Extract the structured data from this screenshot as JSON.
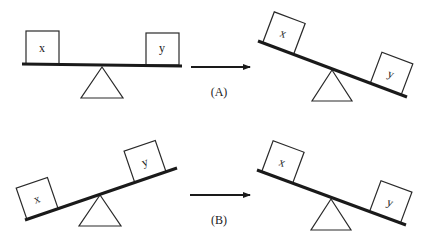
{
  "diagram": {
    "type": "seesaw-balance-comparison",
    "rows": [
      {
        "caption": "(A)",
        "before": {
          "state": "balanced",
          "left_box": "x",
          "right_box": "y"
        },
        "after": {
          "state": "tilted-left-down? no - left up, right down",
          "left_box": "x",
          "right_box": "y"
        }
      },
      {
        "caption": "(B)",
        "before": {
          "state": "left down, right up",
          "left_box": "x",
          "right_box": "y"
        },
        "after": {
          "state": "left up, right down",
          "left_box": "x",
          "right_box": "y"
        }
      }
    ]
  },
  "labels": {
    "x": "x",
    "y": "y",
    "caption_a": "(A)",
    "caption_b": "(B)"
  },
  "colors": {
    "line": "#1a1a1a",
    "background": "#ffffff"
  }
}
